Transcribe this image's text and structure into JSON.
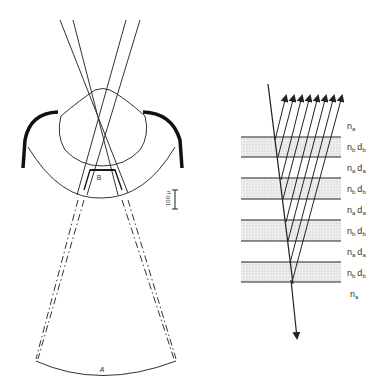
{
  "left_diagram": {
    "label_A": "A",
    "label_B": "B",
    "scale_bar_label": "100 μ"
  },
  "right_diagram": {
    "layer_labels": [
      {
        "n": "n",
        "n_sub": "a",
        "d": "",
        "d_sub": ""
      },
      {
        "n": "n",
        "n_sub": "b",
        "d": "d",
        "d_sub": "b"
      },
      {
        "n": "n",
        "n_sub": "a",
        "d": "d",
        "d_sub": "a"
      },
      {
        "n": "n",
        "n_sub": "b",
        "d": "d",
        "d_sub": "b"
      },
      {
        "n": "n",
        "n_sub": "a",
        "d": "d",
        "d_sub": "a"
      },
      {
        "n": "n",
        "n_sub": "b",
        "d": "d",
        "d_sub": "b"
      },
      {
        "n": "n",
        "n_sub": "a",
        "d": "d",
        "d_sub": "a"
      },
      {
        "n": "n",
        "n_sub": "b",
        "d": "d",
        "d_sub": "b"
      },
      {
        "n": "n",
        "n_sub": "a",
        "d": "",
        "d_sub": ""
      }
    ],
    "layer_fill_color": "#e4e4e4",
    "line_color": "#222222"
  }
}
